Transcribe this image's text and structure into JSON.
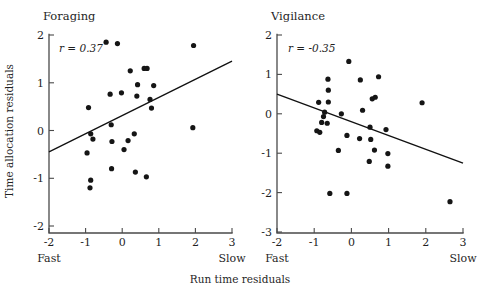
{
  "figure": {
    "x_axis_title": "Run time residuals",
    "y_axis_title": "Time allocation residuals",
    "fast_label": "Fast",
    "slow_label": "Slow"
  },
  "chart_data": [
    {
      "type": "scatter",
      "title": "Foraging",
      "xlabel": "Run time residuals",
      "ylabel": "Time allocation residuals",
      "xlim": [
        -2,
        3
      ],
      "ylim": [
        -2,
        2
      ],
      "xticks": [
        -2,
        -1,
        0,
        1,
        2,
        3
      ],
      "yticks": [
        -2,
        -1,
        0,
        1,
        2
      ],
      "xtick_labels": [
        "-2",
        "-1",
        "0",
        "1",
        "2",
        "3"
      ],
      "ytick_labels": [
        "-2",
        "-1",
        "0",
        "1",
        "2"
      ],
      "x_axis_end_labels": [
        "Fast",
        "Slow"
      ],
      "grid": false,
      "legend": "none",
      "annotation": "r = 0.37",
      "correlation_r": 0.37,
      "trendline": {
        "x": [
          -2,
          3
        ],
        "y": [
          -0.45,
          1.45
        ]
      },
      "points": [
        {
          "x": -0.44,
          "y": 1.85
        },
        {
          "x": -0.13,
          "y": 1.82
        },
        {
          "x": 1.95,
          "y": 1.78
        },
        {
          "x": 0.22,
          "y": 1.25
        },
        {
          "x": 0.6,
          "y": 1.3
        },
        {
          "x": 0.68,
          "y": 1.3
        },
        {
          "x": 0.42,
          "y": 0.96
        },
        {
          "x": 0.86,
          "y": 0.94
        },
        {
          "x": -0.33,
          "y": 0.76
        },
        {
          "x": -0.02,
          "y": 0.79
        },
        {
          "x": 0.4,
          "y": 0.72
        },
        {
          "x": 0.76,
          "y": 0.65
        },
        {
          "x": 0.8,
          "y": 0.47
        },
        {
          "x": -0.92,
          "y": 0.48
        },
        {
          "x": -0.3,
          "y": 0.12
        },
        {
          "x": -0.86,
          "y": -0.07
        },
        {
          "x": -0.8,
          "y": -0.18
        },
        {
          "x": 0.33,
          "y": -0.07
        },
        {
          "x": 0.16,
          "y": -0.21
        },
        {
          "x": -0.28,
          "y": -0.23
        },
        {
          "x": 1.93,
          "y": 0.06
        },
        {
          "x": 0.05,
          "y": -0.4
        },
        {
          "x": -0.96,
          "y": -0.47
        },
        {
          "x": -0.29,
          "y": -0.8
        },
        {
          "x": 0.36,
          "y": -0.87
        },
        {
          "x": 0.66,
          "y": -0.97
        },
        {
          "x": -0.86,
          "y": -1.04
        },
        {
          "x": -0.88,
          "y": -1.2
        }
      ]
    },
    {
      "type": "scatter",
      "title": "Vigilance",
      "xlabel": "Run time residuals",
      "ylabel": "Time allocation residuals",
      "xlim": [
        -2,
        3
      ],
      "ylim": [
        -3,
        2
      ],
      "xticks": [
        -2,
        -1,
        0,
        1,
        2,
        3
      ],
      "yticks": [
        -3,
        -2,
        -1,
        0,
        1,
        2
      ],
      "xtick_labels": [
        "-2",
        "-1",
        "0",
        "1",
        "2",
        "3"
      ],
      "ytick_labels": [
        "-3",
        "-2",
        "-1",
        "0",
        "1",
        "2"
      ],
      "x_axis_end_labels": [
        "Fast",
        "Slow"
      ],
      "grid": false,
      "legend": "none",
      "annotation": "r = -0.35",
      "correlation_r": -0.35,
      "trendline": {
        "x": [
          -2,
          3
        ],
        "y": [
          0.5,
          -1.25
        ]
      },
      "points": [
        {
          "x": -0.07,
          "y": 1.33
        },
        {
          "x": -0.63,
          "y": 0.88
        },
        {
          "x": 0.24,
          "y": 0.86
        },
        {
          "x": 0.73,
          "y": 0.94
        },
        {
          "x": -0.62,
          "y": 0.6
        },
        {
          "x": -0.88,
          "y": 0.29
        },
        {
          "x": -0.62,
          "y": 0.3
        },
        {
          "x": 0.56,
          "y": 0.38
        },
        {
          "x": 0.64,
          "y": 0.42
        },
        {
          "x": 1.9,
          "y": 0.28
        },
        {
          "x": -0.75,
          "y": -0.07
        },
        {
          "x": -0.72,
          "y": 0.04
        },
        {
          "x": -0.27,
          "y": 0.0
        },
        {
          "x": 0.3,
          "y": 0.09
        },
        {
          "x": -0.8,
          "y": -0.22
        },
        {
          "x": -0.65,
          "y": -0.24
        },
        {
          "x": -0.93,
          "y": -0.43
        },
        {
          "x": -0.85,
          "y": -0.47
        },
        {
          "x": 0.5,
          "y": -0.34
        },
        {
          "x": 0.93,
          "y": -0.4
        },
        {
          "x": -0.12,
          "y": -0.55
        },
        {
          "x": 0.22,
          "y": -0.63
        },
        {
          "x": 0.52,
          "y": -0.65
        },
        {
          "x": -0.35,
          "y": -0.93
        },
        {
          "x": 0.62,
          "y": -0.92
        },
        {
          "x": 0.98,
          "y": -1.01
        },
        {
          "x": 0.48,
          "y": -1.21
        },
        {
          "x": 0.98,
          "y": -1.33
        },
        {
          "x": -0.58,
          "y": -2.02
        },
        {
          "x": -0.12,
          "y": -2.02
        },
        {
          "x": 2.65,
          "y": -2.23
        }
      ]
    }
  ]
}
